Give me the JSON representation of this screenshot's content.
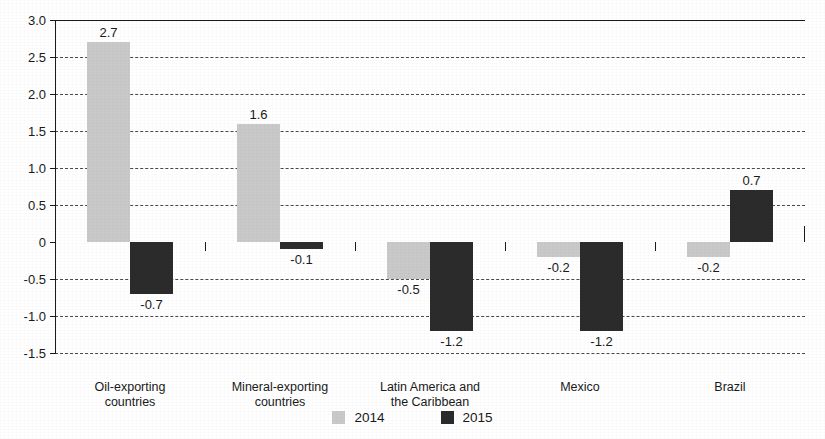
{
  "chart_data": {
    "type": "bar",
    "title": "",
    "xlabel": "",
    "ylabel": "",
    "ylim": [
      -1.5,
      3.0
    ],
    "ytick_labels": [
      "3.0",
      "2.5",
      "2.0",
      "1.5",
      "1.0",
      "0.5",
      "0",
      "-0.5",
      "-1.0",
      "-1.5"
    ],
    "ytick_values": [
      3.0,
      2.5,
      2.0,
      1.5,
      1.0,
      0.5,
      0,
      -0.5,
      -1.0,
      -1.5
    ],
    "grid": "horizontal-dashed",
    "legend_position": "bottom-center",
    "categories": [
      "Oil-exporting countries",
      "Mineral-exporting countries",
      "Latin America and the Caribbean",
      "Mexico",
      "Brazil"
    ],
    "category_lines": [
      [
        "Oil-exporting",
        "countries"
      ],
      [
        "Mineral-exporting",
        "countries"
      ],
      [
        "Latin America and",
        "the Caribbean"
      ],
      [
        "Mexico"
      ],
      [
        "Brazil"
      ]
    ],
    "series": [
      {
        "name": "2014",
        "color": "#c9c9c9",
        "values": [
          2.7,
          1.6,
          -0.5,
          -0.2,
          -0.2
        ],
        "labels": [
          "2.7",
          "1.6",
          "-0.5",
          "-0.2",
          "-0.2"
        ]
      },
      {
        "name": "2015",
        "color": "#2b2b2b",
        "values": [
          -0.7,
          -0.1,
          -1.2,
          -1.2,
          0.7
        ],
        "labels": [
          "-0.7",
          "-0.1",
          "-1.2",
          "-1.2",
          "0.7"
        ]
      }
    ]
  },
  "legend": {
    "items": [
      {
        "label": "2014",
        "color": "#c9c9c9"
      },
      {
        "label": "2015",
        "color": "#2b2b2b"
      }
    ]
  },
  "colors": {
    "series_2014": "#c9c9c9",
    "series_2015": "#2b2b2b",
    "axis": "#1a1a1a",
    "grid": "#4a4a4a",
    "background": "#ffffff"
  }
}
